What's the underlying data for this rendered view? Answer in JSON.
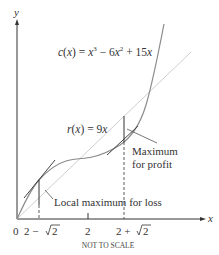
{
  "diagram": {
    "axes": {
      "x_label": "x",
      "y_label": "y",
      "origin_label": "0",
      "x_ticks": [
        {
          "label_left": "2 − ",
          "label_sqrt": "2",
          "position": "2-sqrt2"
        },
        {
          "label": "2",
          "position": "2"
        },
        {
          "label_left": "2 + ",
          "label_sqrt": "2",
          "position": "2+sqrt2"
        }
      ]
    },
    "curves": {
      "cost": {
        "label": "c(x) = x³ − 6x² + 15x",
        "label_parts": {
          "c": "c",
          "x": "x",
          "rest1": ") = ",
          "x3": "x",
          "e3": "3",
          "mid": " − 6",
          "x2": "x",
          "e2": "2",
          "end": " + 15",
          "xl": "x"
        }
      },
      "revenue": {
        "label": "r(x) = 9x",
        "label_parts": {
          "r": "r",
          "x": "x",
          "rest": ") = 9",
          "xl": "x"
        }
      }
    },
    "annotations": {
      "loss": "Local maximum for loss",
      "profit_line1": "Maximum",
      "profit_line2": "for profit"
    },
    "footnote": "NOT TO SCALE",
    "colors": {
      "axis": "#333333",
      "cost_curve": "#888888",
      "revenue_line": "#cccccc",
      "tangent": "#444444",
      "text": "#333333"
    }
  }
}
